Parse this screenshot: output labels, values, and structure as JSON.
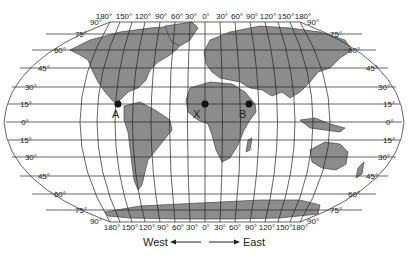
{
  "map": {
    "projection": "Robinson-style world map with latitude/longitude grid",
    "colors": {
      "land": "#8c8c8c",
      "ocean": "#ffffff",
      "grid": "#222222"
    },
    "top_longitude_labels": [
      "180°",
      "150°",
      "120°",
      "90°",
      "60°",
      "30°",
      "0°",
      "30°",
      "60°",
      "90°",
      "120°",
      "150°",
      "180°"
    ],
    "bottom_longitude_labels": [
      "180°",
      "150°",
      "120°",
      "90°",
      "60°",
      "30°",
      "0°",
      "30°",
      "60°",
      "90°",
      "120°",
      "150°",
      "180°"
    ],
    "left_latitude_labels": [
      "90°",
      "75°",
      "60°",
      "45°",
      "30°",
      "15°",
      "0°",
      "15°",
      "30°",
      "45°",
      "60°",
      "75°",
      "90°"
    ],
    "right_latitude_labels": [
      "90°",
      "75°",
      "60°",
      "45°",
      "30°",
      "15°",
      "0°",
      "15°",
      "30°",
      "45°",
      "60°",
      "75°",
      "90°"
    ],
    "points": [
      {
        "label": "A",
        "description": "Central America, ~15°N 90°W"
      },
      {
        "label": "X",
        "description": "West Africa, ~15°N 0°"
      },
      {
        "label": "B",
        "description": "East Africa, ~15°N 40°E"
      }
    ],
    "direction": {
      "west": "West",
      "east": "East"
    }
  }
}
